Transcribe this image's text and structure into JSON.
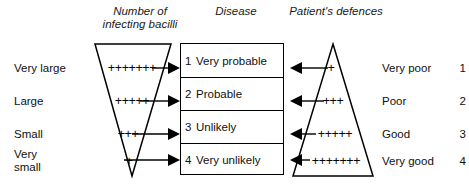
{
  "headings": {
    "bacilli": "Number of\ninfecting bacilli",
    "disease": "Disease",
    "defences": "Patient's defences"
  },
  "left_labels": [
    {
      "text": "Very large",
      "pluses": "+++++++"
    },
    {
      "text": "Large",
      "pluses": "+++++"
    },
    {
      "text": "Small",
      "pluses": "+++"
    },
    {
      "text": "Very\nsmall",
      "pluses": "+"
    }
  ],
  "disease_rows": [
    {
      "number": "1",
      "text": "Very probable"
    },
    {
      "number": "2",
      "text": "Probable"
    },
    {
      "number": "3",
      "text": "Unlikely"
    },
    {
      "number": "4",
      "text": "Very unlikely"
    }
  ],
  "right_labels": [
    {
      "text": "Very poor",
      "number": "1",
      "pluses": "+"
    },
    {
      "text": "Poor",
      "number": "2",
      "pluses": "+++"
    },
    {
      "text": "Good",
      "number": "3",
      "pluses": "+++++"
    },
    {
      "text": "Very good",
      "number": "4",
      "pluses": "+++++++"
    }
  ],
  "colors": {
    "ink": "#000000",
    "text": "#101010",
    "background": "#ffffff"
  }
}
